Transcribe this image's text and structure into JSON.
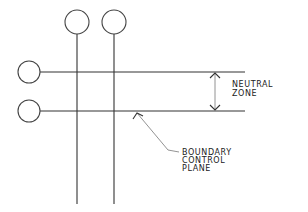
{
  "diagram": {
    "labels": {
      "neutral_zone": [
        "NEUTRAL",
        "ZONE"
      ],
      "boundary_control_plane": [
        "BOUNDARY",
        "CONTROL",
        "PLANE"
      ]
    },
    "nodes": {
      "top": [
        {
          "id": "top-1",
          "cx": 77,
          "cy": 22,
          "r": 12
        },
        {
          "id": "top-2",
          "cx": 114,
          "cy": 22,
          "r": 12
        }
      ],
      "left": [
        {
          "id": "left-1",
          "cx": 29,
          "cy": 72,
          "r": 11
        },
        {
          "id": "left-2",
          "cx": 29,
          "cy": 111,
          "r": 11
        }
      ]
    },
    "lines": {
      "vertical_x": [
        77,
        114
      ],
      "horizontal_y": [
        72,
        111
      ]
    },
    "colors": {
      "line": "#333333",
      "background": "#ffffff"
    }
  }
}
